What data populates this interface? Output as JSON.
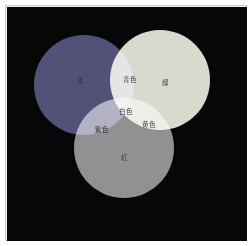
{
  "figure": {
    "background_color": "#070707",
    "frame_color": "#c9c9c9",
    "canvas_width": 240,
    "canvas_height": 234
  },
  "chart_data": {
    "type": "diagram",
    "subtype": "venn-3-additive-color-mixing",
    "title": "",
    "grid": false,
    "legend": "none",
    "background": "#070707",
    "circles": [
      {
        "id": "blue",
        "label": "青",
        "fill": "#4d4d75",
        "cx": 77,
        "cy": 78,
        "r": 50
      },
      {
        "id": "green",
        "label": "緑",
        "fill": "#d8d8cd",
        "cx": 153,
        "cy": 73,
        "r": 50
      },
      {
        "id": "red",
        "label": "紅",
        "fill": "#8e8e8e",
        "cx": 117,
        "cy": 141,
        "r": 50
      }
    ],
    "intersections": [
      {
        "id": "cyan",
        "label": "青色",
        "members": [
          "blue",
          "green"
        ],
        "fill": "#e3e3de"
      },
      {
        "id": "magenta",
        "label": "紫色",
        "members": [
          "blue",
          "red"
        ],
        "fill": "#5c5c78"
      },
      {
        "id": "yellow",
        "label": "黄色",
        "members": [
          "green",
          "red"
        ],
        "fill": "#fcfcf2"
      },
      {
        "id": "white",
        "label": "白色",
        "members": [
          "blue",
          "green",
          "red"
        ],
        "fill": "#ffffff"
      }
    ],
    "labels": [
      {
        "id": "blue",
        "text": "青",
        "x": 68,
        "y": 69
      },
      {
        "id": "green",
        "text": "緑",
        "x": 153,
        "y": 71
      },
      {
        "id": "red",
        "text": "紅",
        "x": 112,
        "y": 146
      },
      {
        "id": "cyan",
        "text": "青色",
        "x": 118,
        "y": 68
      },
      {
        "id": "magenta",
        "text": "紫色",
        "x": 90,
        "y": 118
      },
      {
        "id": "yellow",
        "text": "黄色",
        "x": 137,
        "y": 113
      },
      {
        "id": "white",
        "text": "白色",
        "x": 114,
        "y": 100
      }
    ]
  }
}
